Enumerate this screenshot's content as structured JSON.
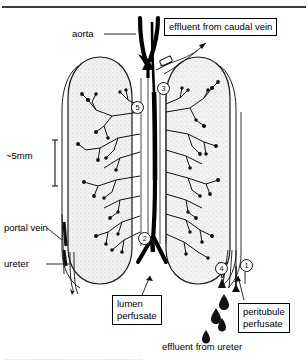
{
  "figure": {
    "scale_label": "~5mm",
    "background_color": "#ffffff",
    "ink_color": "#000000",
    "tissue_fill": "#f2f2f2"
  },
  "labels": {
    "aorta": "aorta",
    "portal_vein": "portal vein",
    "ureter": "ureter",
    "scale": "~5mm",
    "effluent_ureter": "effluent from ureter"
  },
  "boxed_labels": {
    "effluent_caudal_vein": "effluent from caudal vein",
    "lumen_perfusate": {
      "line1": "lumen",
      "line2": "perfusate"
    },
    "peritubule_perfusate": {
      "line1": "peritubule",
      "line2": "perfusate"
    }
  },
  "callout_numbers": [
    {
      "id": "callout-1",
      "value": "1"
    },
    {
      "id": "callout-2",
      "value": "2"
    },
    {
      "id": "callout-3",
      "value": "3"
    },
    {
      "id": "callout-4",
      "value": "4"
    },
    {
      "id": "callout-5",
      "value": "5"
    }
  ],
  "caption_ghost": "......................................................................."
}
